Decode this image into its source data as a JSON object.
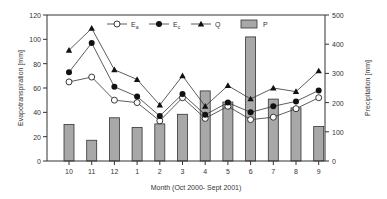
{
  "chart_data": {
    "type": "bar+line",
    "title": "",
    "xlabel": "Month (Oct 2000- Sept 2001)",
    "ylabel": "Evapotranspiration [mm]",
    "ylabel_right": "Precipitation [mm]",
    "ylim": [
      0,
      120
    ],
    "ylim_right": [
      0,
      500
    ],
    "yticks": [
      0,
      20,
      40,
      60,
      80,
      100,
      120
    ],
    "yticks_right": [
      0,
      100,
      200,
      300,
      400,
      500
    ],
    "categories": [
      "10",
      "11",
      "12",
      "1",
      "2",
      "3",
      "4",
      "5",
      "6",
      "7",
      "8",
      "9"
    ],
    "series": [
      {
        "name": "Ea",
        "label_main": "E",
        "label_sub": "a",
        "type": "line",
        "marker": "open-circle",
        "axis": "left",
        "values": [
          65,
          69,
          50,
          48,
          33,
          52,
          35,
          45,
          34,
          36,
          43,
          52
        ]
      },
      {
        "name": "Ec",
        "label_main": "E",
        "label_sub": "c",
        "type": "line",
        "marker": "filled-circle",
        "axis": "left",
        "values": [
          73,
          97,
          61,
          53,
          37,
          55,
          38,
          48,
          40,
          45,
          49,
          58
        ]
      },
      {
        "name": "Q",
        "label_main": "Q",
        "label_sub": "",
        "type": "line",
        "marker": "filled-triangle",
        "axis": "left",
        "values": [
          91,
          109,
          75,
          67,
          46,
          70,
          45,
          62,
          51,
          60,
          57,
          74
        ]
      },
      {
        "name": "P",
        "label_main": "P",
        "label_sub": "",
        "type": "bar",
        "axis": "right",
        "color": "#a8a8a8",
        "values": [
          125,
          71,
          148,
          115,
          127,
          160,
          240,
          202,
          425,
          212,
          182,
          118
        ]
      }
    ],
    "legend_position": "top-inside",
    "grid": false
  }
}
